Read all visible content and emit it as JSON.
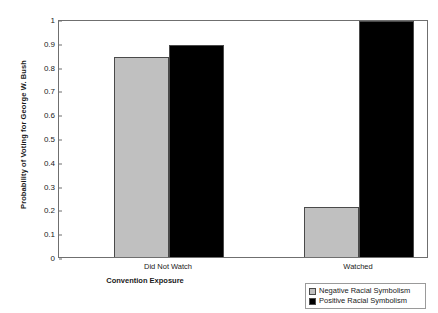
{
  "chart_data": {
    "type": "bar",
    "title": "",
    "xlabel": "Convention Exposure",
    "ylabel": "Probability of Voting for George W. Bush",
    "categories": [
      "Did Not Watch",
      "Watched"
    ],
    "series": [
      {
        "name": "Negative Racial Symbolism",
        "color": "#c0c0c0",
        "values": [
          0.84,
          0.21
        ]
      },
      {
        "name": "Positive Racial Symbolism",
        "color": "#000000",
        "values": [
          0.89,
          0.99
        ]
      }
    ],
    "ylim": [
      0,
      1
    ],
    "yticks": [
      "0",
      "0.1",
      "0.2",
      "0.3",
      "0.4",
      "0.5",
      "0.6",
      "0.7",
      "0.8",
      "0.9",
      "1"
    ],
    "ytick_values": [
      0,
      0.1,
      0.2,
      0.3,
      0.4,
      0.5,
      0.6,
      0.7,
      0.8,
      0.9,
      1
    ],
    "grid": false,
    "legend_position": "bottom-right"
  },
  "axis": {
    "y_title": "Probability of Voting for George W. Bush",
    "x_title": "Convention Exposure"
  },
  "legend": {
    "items": [
      {
        "label": "Negative Racial Symbolism"
      },
      {
        "label": "Positive Racial Symbolism"
      }
    ]
  }
}
